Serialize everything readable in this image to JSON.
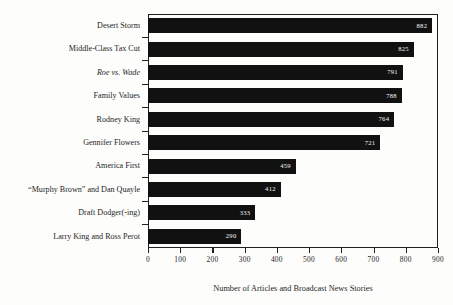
{
  "chart_data": {
    "type": "bar",
    "orientation": "horizontal",
    "title": "",
    "xlabel": "Number of Articles and Broadcast News Stories",
    "ylabel": "",
    "xlim": [
      0,
      900
    ],
    "xticks": [
      0,
      100,
      200,
      300,
      400,
      500,
      600,
      700,
      800,
      900
    ],
    "xtick_labels": [
      "0",
      "100",
      "200",
      "300",
      "400",
      "500",
      "600",
      "700",
      "800",
      "900"
    ],
    "grid": false,
    "legend": false,
    "bar_color": "#111111",
    "value_label_color": "#f6f6f4",
    "categories": [
      "Desert Storm",
      "Middle-Class Tax Cut",
      "Roe vs. Wade",
      "Family Values",
      "Rodney King",
      "Gennifer Flowers",
      "America First",
      "“Murphy Brown” and Dan Quayle",
      "Draft Dodger(-ing)",
      "Larry King and Ross Perot"
    ],
    "values": [
      882,
      825,
      791,
      788,
      764,
      721,
      459,
      412,
      333,
      290
    ],
    "value_labels": [
      "882",
      "825",
      "791",
      "788",
      "764",
      "721",
      "459",
      "412",
      "333",
      "290"
    ],
    "category_styles": [
      "normal",
      "normal",
      "italic",
      "normal",
      "normal",
      "normal",
      "normal",
      "normal",
      "normal",
      "normal"
    ]
  }
}
